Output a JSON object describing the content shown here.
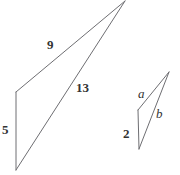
{
  "figure": {
    "type": "geometry-diagram",
    "background_color": "#ffffff",
    "stroke_color": "#6e6e72",
    "label_color": "#333333",
    "stroke_width": 1,
    "shapes": [
      {
        "name": "large-triangle",
        "points": "125,1 16,92 16,170",
        "labels": [
          "9",
          "13",
          "5"
        ]
      },
      {
        "name": "small-triangle",
        "points": "169,72 138,110 139,149",
        "labels": [
          "a",
          "b",
          "2"
        ]
      }
    ],
    "labels": [
      {
        "id": "side-9",
        "text": "9",
        "x": 47,
        "y": 38,
        "style": "number"
      },
      {
        "id": "side-13",
        "text": "13",
        "x": 76,
        "y": 81,
        "style": "number"
      },
      {
        "id": "side-5",
        "text": "5",
        "x": 2,
        "y": 123,
        "style": "number"
      },
      {
        "id": "side-a",
        "text": "a",
        "x": 138,
        "y": 87,
        "style": "variable"
      },
      {
        "id": "side-b",
        "text": "b",
        "x": 156,
        "y": 107,
        "style": "variable"
      },
      {
        "id": "side-2",
        "text": "2",
        "x": 123,
        "y": 127,
        "style": "number"
      }
    ]
  }
}
